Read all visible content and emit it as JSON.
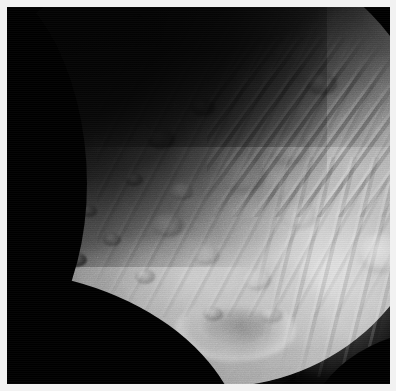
{
  "image": {
    "subject": "Phobos",
    "subject_description": "Heavily cratered natural satellite imaged against black space",
    "view_type": "grayscale spacecraft photograph",
    "alt_text": "Grayscale close-up of the cratered, grooved surface of the moon Phobos, lit from the lower right with the upper-left portion falling into shadow against black space.",
    "orientation": "landscape-square",
    "width_px": 396,
    "height_px": 391
  },
  "frame": {
    "border_color": "#f2f2f2",
    "border_width_px": 7,
    "sky_color": "#000000"
  },
  "scene": {
    "illumination_direction": "lower-right",
    "terminator_location": "upper-left",
    "limb_location": "bottom and right",
    "body_fill_fraction": "approximately three quarters of the frame"
  },
  "palette": {
    "sky": "#000000",
    "shadow": "#0a0a0a",
    "midtone_regolith": "#8e8e8e",
    "bright_regolith": "#c8c8c8",
    "highlight": "#e6e6e6",
    "border": "#f2f2f2"
  },
  "features": {
    "grooves": {
      "label": "linear grooves and striations",
      "count_visible": 3,
      "orientation": "diagonal, upper-left to lower-right"
    },
    "craters": [
      {
        "name": "bright-rimmed-limb-crater",
        "region": "left terminator",
        "size": "small",
        "tone": "bright rim with deep black shadow"
      },
      {
        "name": "large-shallow-basin",
        "region": "bottom center",
        "size": "large",
        "tone": "bright arcuate rim"
      },
      {
        "name": "bright-limb-crater-right",
        "region": "right limb",
        "size": "medium",
        "tone": "bright"
      },
      {
        "name": "central-crater-field",
        "region": "center",
        "size": "mixed small to medium",
        "tone": "mottled gray"
      }
    ]
  }
}
